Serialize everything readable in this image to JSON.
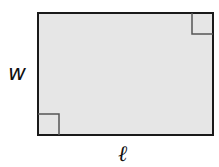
{
  "diagram": {
    "shape": "rectangle",
    "rect": {
      "x": 38,
      "y": 13,
      "width": 175,
      "height": 122
    },
    "fill_color": "#e6e6e6",
    "stroke_color": "#1a1a1a",
    "stroke_width": 2,
    "right_angle_markers": [
      {
        "corner": "top-right",
        "x": 192,
        "y": 13,
        "size": 21
      },
      {
        "corner": "bottom-left",
        "x": 38,
        "y": 114,
        "size": 21
      }
    ],
    "marker_color": "#555555",
    "labels": {
      "width": "w",
      "length": "ℓ"
    }
  }
}
